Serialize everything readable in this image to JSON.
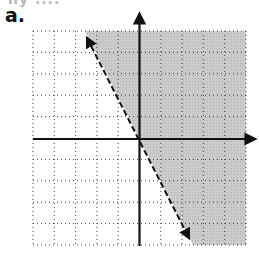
{
  "header": {
    "cutoff_text": "ny ....",
    "part_label": "a."
  },
  "graph": {
    "type": "linear-inequality",
    "grid": {
      "x_min": -5,
      "x_max": 5,
      "y_min": -5,
      "y_max": 5,
      "spacing_px": 21.3,
      "style": "dotted"
    },
    "boundary_line": {
      "style": "dashed",
      "slope": -2,
      "intercept": 0,
      "arrows": "both"
    },
    "shaded_region": {
      "side": "right/above",
      "color": "#c8c8c8",
      "inequality": "y > -2x"
    },
    "colors": {
      "axis": "#111111",
      "grid": "#555555",
      "shade": "#c8c8c8"
    }
  }
}
